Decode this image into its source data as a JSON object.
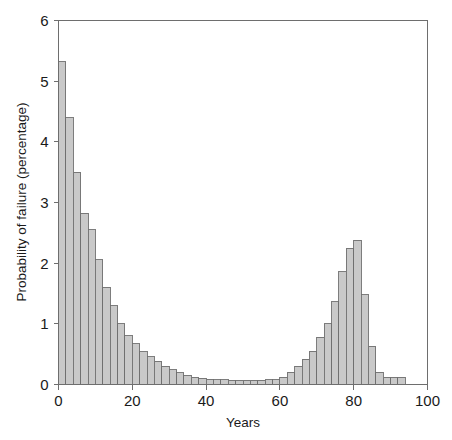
{
  "chart_data": {
    "type": "bar",
    "title": "",
    "subtitle": "",
    "xlabel": "Years",
    "ylabel": "Probability of failure (percentage)",
    "xlim": [
      0,
      100
    ],
    "ylim": [
      0,
      6
    ],
    "xticks": [
      0,
      20,
      40,
      60,
      80,
      100
    ],
    "xtick_labels": [
      "0",
      "20",
      "40",
      "60",
      "80",
      "100"
    ],
    "yticks": [
      0,
      1,
      2,
      3,
      4,
      5,
      6
    ],
    "ytick_labels": [
      "0",
      "1",
      "2",
      "3",
      "4",
      "5",
      "6"
    ],
    "grid": false,
    "legend": null,
    "bin_width": 2,
    "bar_color": "#c9c9c9",
    "bar_edge_color": "#6f6f6f",
    "axis_color": "#6e6e6e",
    "bin_starts": [
      0,
      2,
      4,
      6,
      8,
      10,
      12,
      14,
      16,
      18,
      20,
      22,
      24,
      26,
      28,
      30,
      32,
      34,
      36,
      38,
      40,
      42,
      44,
      46,
      48,
      50,
      52,
      54,
      56,
      58,
      60,
      62,
      64,
      66,
      68,
      70,
      72,
      74,
      76,
      78,
      80,
      82,
      84,
      86,
      88,
      90,
      92
    ],
    "categories": [
      "0-2",
      "2-4",
      "4-6",
      "6-8",
      "8-10",
      "10-12",
      "12-14",
      "14-16",
      "16-18",
      "18-20",
      "20-22",
      "22-24",
      "24-26",
      "26-28",
      "28-30",
      "30-32",
      "32-34",
      "34-36",
      "36-38",
      "38-40",
      "40-42",
      "42-44",
      "44-46",
      "46-48",
      "48-50",
      "50-52",
      "52-54",
      "54-56",
      "56-58",
      "58-60",
      "60-62",
      "62-64",
      "64-66",
      "66-68",
      "68-70",
      "70-72",
      "72-74",
      "74-76",
      "76-78",
      "78-80",
      "80-82",
      "82-84",
      "84-86",
      "86-88",
      "88-90",
      "90-92",
      "92-94"
    ],
    "values": [
      5.32,
      4.4,
      3.5,
      2.82,
      2.55,
      2.06,
      1.6,
      1.3,
      1.0,
      0.8,
      0.67,
      0.54,
      0.46,
      0.38,
      0.3,
      0.24,
      0.19,
      0.15,
      0.12,
      0.1,
      0.09,
      0.08,
      0.08,
      0.07,
      0.07,
      0.07,
      0.07,
      0.07,
      0.08,
      0.08,
      0.12,
      0.2,
      0.3,
      0.42,
      0.55,
      0.78,
      1.0,
      1.36,
      1.86,
      2.25,
      2.38,
      1.48,
      0.63,
      0.2,
      0.12,
      0.12,
      0.12
    ]
  },
  "figure": {
    "width": 452,
    "height": 440,
    "background": "#ffffff"
  }
}
